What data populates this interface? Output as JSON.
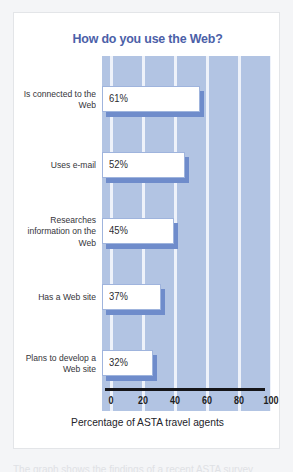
{
  "card": {
    "title": "How do you use the Web?",
    "xlabel": "Percentage of ASTA travel agents",
    "caption_cutoff": "The graph shows the findings of a recent ASTA survey"
  },
  "colors": {
    "title": "#4b60a8",
    "plot_background": "#b2c4e3",
    "gridline": "#eef2fa",
    "bar_fill": "#ffffff",
    "bar_shadow": "#6f8ccb",
    "bar_border": "#9fb4dd",
    "axis_line": "#151519",
    "card_background": "#ffffff",
    "page_background": "#f4f5f7"
  },
  "chart_data": {
    "type": "bar",
    "orientation": "horizontal",
    "title": "How do you use the Web?",
    "xlabel": "Percentage of ASTA travel agents",
    "ylabel": "",
    "categories": [
      "Is connected to the Web",
      "Uses e-mail",
      "Researches information on the Web",
      "Has a Web site",
      "Plans to develop a Web site"
    ],
    "values": [
      61,
      52,
      45,
      37,
      32
    ],
    "data_labels": [
      "61%",
      "52%",
      "45%",
      "37%",
      "32%"
    ],
    "xlim": [
      0,
      100
    ],
    "xticks": [
      0,
      20,
      40,
      60,
      80,
      100
    ],
    "xtick_labels": [
      "0",
      "20",
      "40",
      "60",
      "80",
      "100"
    ],
    "grid": true,
    "grid_axis": "x",
    "legend": false
  }
}
